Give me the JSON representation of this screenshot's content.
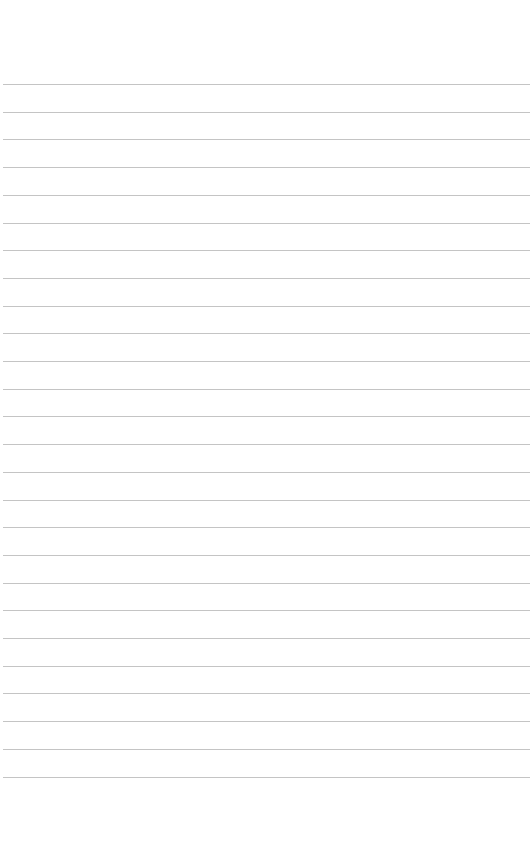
{
  "page": {
    "type": "lined-paper",
    "background_color": "#ffffff",
    "rule_color": "#c4c4c4",
    "rule_count": 26,
    "first_rule_y": 84,
    "rule_spacing": 27.7,
    "rule_left": 3,
    "rule_width": 527
  }
}
